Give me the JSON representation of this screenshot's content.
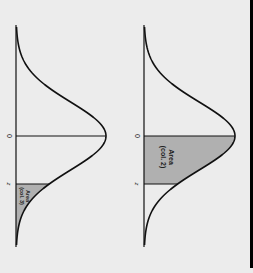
{
  "figure": {
    "orientation": "rotated-90-clockwise",
    "colors": {
      "background": "#ececec",
      "curve": "#111111",
      "shade": "#b0b0b0",
      "border": "#000000"
    },
    "panels": [
      {
        "id": "tail-area",
        "mean_label": "0",
        "z_label": "z",
        "area_label_line1": "Area",
        "area_label_line2": "(col. 3)",
        "shaded_region": "beyond z (upper tail)"
      },
      {
        "id": "center-area",
        "mean_label": "0",
        "z_label": "z",
        "area_label_line1": "Area",
        "area_label_line2": "(col. 2)",
        "shaded_region": "between 0 and z"
      }
    ]
  }
}
